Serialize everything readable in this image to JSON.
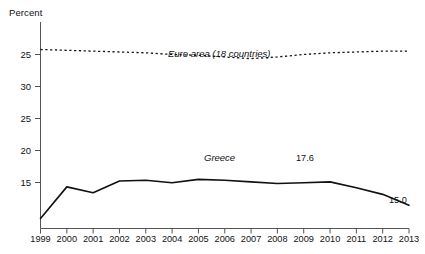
{
  "chart_data": {
    "type": "line",
    "title": "",
    "xlabel": "",
    "ylabel": "Percent",
    "ylabel_display": "Percent",
    "x": [
      1999,
      2000,
      2001,
      2002,
      2003,
      2004,
      2005,
      2006,
      2007,
      2008,
      2009,
      2010,
      2011,
      2012,
      2013
    ],
    "xtick_labels": [
      "1999",
      "2000",
      "2001",
      "2002",
      "2003",
      "2004",
      "2005",
      "2006",
      "2007",
      "2008",
      "2009",
      "2010",
      "2011",
      "2012",
      "2013"
    ],
    "ytick_labels": [
      "25",
      "30",
      "25",
      "20",
      "15"
    ],
    "ytick_values": [
      35,
      30,
      25,
      20,
      15
    ],
    "ylim": [
      12.2,
      37.0
    ],
    "xlim": [
      1999,
      2013
    ],
    "grid": false,
    "legend_position": "inline-annotations",
    "series": [
      {
        "name": "Euro area (18 countries)",
        "style": "dotted",
        "color": "#111111",
        "values": [
          33.7,
          33.6,
          33.5,
          33.4,
          33.3,
          33.1,
          33.0,
          32.8,
          32.6,
          32.8,
          33.1,
          33.3,
          33.4,
          33.5,
          33.5
        ]
      },
      {
        "name": "Greece",
        "style": "solid",
        "color": "#111111",
        "values": [
          13.4,
          17.2,
          16.5,
          17.9,
          18.0,
          17.7,
          18.1,
          18.0,
          17.8,
          17.6,
          17.7,
          17.8,
          17.1,
          16.3,
          15.0
        ]
      }
    ],
    "annotations": [
      {
        "text": "Euro area (18 countries)",
        "series": "Euro area (18 countries)",
        "kind": "series-label"
      },
      {
        "text": "Greece",
        "series": "Greece",
        "kind": "series-label"
      },
      {
        "text": "17.6",
        "series": "Greece",
        "x": 2009,
        "value": 17.6,
        "kind": "point-label"
      },
      {
        "text": "15.0",
        "series": "Greece",
        "x": 2013,
        "value": 15.0,
        "kind": "point-label"
      }
    ]
  },
  "axes": {
    "y_title": "Percent",
    "y_ticks": [
      "25",
      "30",
      "25",
      "20",
      "15"
    ],
    "x_ticks": [
      "1999",
      "2000",
      "2001",
      "2002",
      "2003",
      "2004",
      "2005",
      "2006",
      "2007",
      "2008",
      "2009",
      "2010",
      "2011",
      "2012",
      "2013"
    ]
  },
  "labels": {
    "euro_area": "Euro area (18 countries)",
    "greece": "Greece",
    "value_2009": "17.6",
    "value_2013": "15.0"
  },
  "colors": {
    "line": "#111111",
    "axis": "#555555",
    "background": "#ffffff",
    "text": "#111111"
  }
}
